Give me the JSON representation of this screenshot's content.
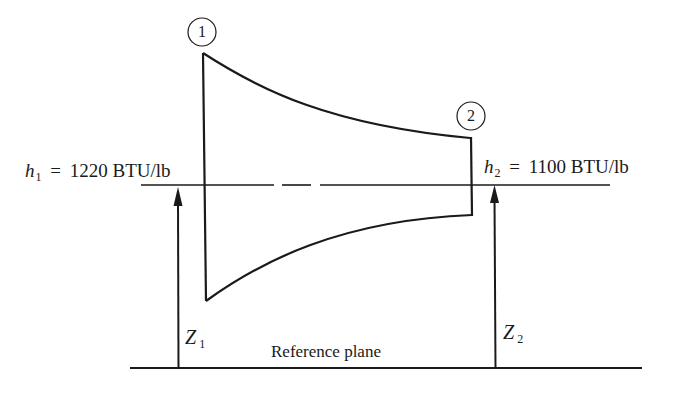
{
  "diagram": {
    "state_points": [
      {
        "id": "1",
        "label": "1"
      },
      {
        "id": "2",
        "label": "2"
      }
    ],
    "enthalpy_labels": [
      {
        "symbol": "h",
        "subscript": "1",
        "equals": "=",
        "value": "1220",
        "unit": "BTU/lb"
      },
      {
        "symbol": "h",
        "subscript": "2",
        "equals": "=",
        "value": "1100",
        "unit": "BTU/lb"
      }
    ],
    "elevation_labels": [
      {
        "symbol": "Z",
        "subscript": "1"
      },
      {
        "symbol": "Z",
        "subscript": "2"
      }
    ],
    "reference_plane_label": "Reference plane",
    "colors": {
      "line": "#1a1a1a",
      "background": "#ffffff"
    }
  }
}
